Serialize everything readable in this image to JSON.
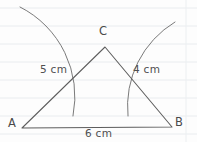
{
  "figure": {
    "background_color": "#fdfdfd",
    "ink_color": "#5d5d5d",
    "rule_color": "#e9ecef",
    "vertices": [
      {
        "id": "A",
        "label": "A",
        "x": 22,
        "y": 128,
        "label_x": 8,
        "label_y": 118
      },
      {
        "id": "B",
        "label": "B",
        "x": 172,
        "y": 127,
        "label_x": 175,
        "label_y": 117
      },
      {
        "id": "C",
        "label": "C",
        "x": 105,
        "y": 47,
        "label_x": 99,
        "label_y": 26
      }
    ],
    "sides": [
      {
        "id": "AC",
        "label": "5 cm",
        "label_x": 40,
        "label_y": 64
      },
      {
        "id": "BC",
        "label": "4 cm",
        "label_x": 133,
        "label_y": 64
      },
      {
        "id": "AB",
        "label": "6 cm",
        "label_x": 85,
        "label_y": 128
      }
    ],
    "paths": {
      "triangle": "M 22 128 L 105 47 L 172 127 L 22 128 Z",
      "arc_from_a": "M 20 7 A 100 100 0 0 1 73 116",
      "arc_from_b": "M 175 22 A 98 98 0 0 0 128 116"
    },
    "ruled_lines_y": [
      8,
      26,
      44,
      62,
      80,
      98,
      116,
      134
    ],
    "margin_line_x": 186
  }
}
